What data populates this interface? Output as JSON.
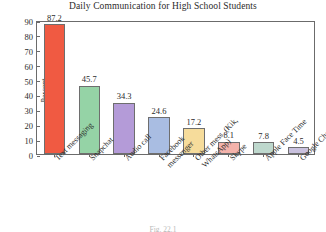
{
  "chart_data": {
    "type": "bar",
    "title": "Daily Communication for High School Students",
    "xlabel": "",
    "ylabel": "Percent",
    "ylim": [
      0,
      90
    ],
    "yticks": [
      0,
      10,
      20,
      30,
      40,
      50,
      60,
      70,
      80,
      90
    ],
    "ytick_labels": [
      "0",
      "10",
      "20",
      "30",
      "40",
      "50",
      "60",
      "70",
      "80",
      "90"
    ],
    "grid": false,
    "legend": "none",
    "categories": [
      "Text messaging",
      "Snapchat",
      "Audio call",
      "Facebook messenger",
      "Other mess. (Kik, WhatsApp)",
      "Skype",
      "Apple Face Time",
      "Google Chat"
    ],
    "category_lines": [
      [
        "Text messaging"
      ],
      [
        "Snapchat"
      ],
      [
        "Audio call"
      ],
      [
        "Facebook",
        "messenger"
      ],
      [
        "Other mess. (Kik,",
        "WhatsApp)"
      ],
      [
        "Skype"
      ],
      [
        "Apple Face Time"
      ],
      [
        "Google Chat"
      ]
    ],
    "values": [
      87.2,
      45.7,
      34.3,
      24.6,
      17.2,
      8.1,
      7.8,
      4.5
    ],
    "value_labels": [
      "87.2",
      "45.7",
      "34.3",
      "24.6",
      "17.2",
      "8.1",
      "7.8",
      "4.5"
    ],
    "colors": [
      "#F05A42",
      "#95D3A6",
      "#B49BD8",
      "#A9BDE2",
      "#F6DC9B",
      "#F4B3AB",
      "#BED8CD",
      "#C9C1DE"
    ],
    "bar_edge_color": "#6E6E6E",
    "frame_color": "#6B6B6B",
    "text_color": "#2B2B2B",
    "background": "#FFFFFF"
  },
  "figure": {
    "caption": "Fig. 22.1"
  }
}
